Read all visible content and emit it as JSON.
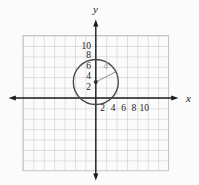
{
  "figure": {
    "x_axis_label": "x",
    "y_axis_label": "y",
    "y_tick_labels": [
      "10",
      "8",
      "6",
      "4",
      "2"
    ],
    "x_tick_labels": [
      "2",
      "4",
      "6",
      "8",
      "10"
    ],
    "units_per_gridline": 2,
    "circle": {
      "center_x": 0,
      "center_y": 3,
      "radius": 4
    },
    "radius_label": "4"
  },
  "colors": {
    "background": "#fbfbfb",
    "grid_line": "#bdbdbd",
    "axis": "#1c1c1c",
    "tick_label": "#1c1c1c",
    "circle_stroke": "#4a4a4a",
    "radius_line": "#8f8f8f",
    "radius_label": "#9c9c9c",
    "center_dot": "#2e2e2e"
  }
}
